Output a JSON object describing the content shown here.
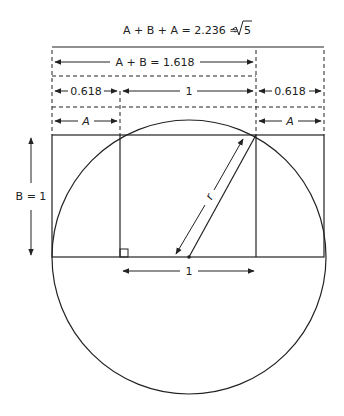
{
  "diagram": {
    "title_parts": {
      "lhs": "A + B + A = 2.236 ≈ ",
      "root": "5"
    },
    "a_plus_b": "A + B = 1.618",
    "left_segment": "0.618",
    "middle_segment": "1",
    "right_segment": "0.618",
    "left_a": "A",
    "right_a": "A",
    "height_label": "B = 1",
    "radius_label": "r",
    "base_label": "1",
    "colors": {
      "line": "#222222",
      "background": "#ffffff"
    }
  }
}
